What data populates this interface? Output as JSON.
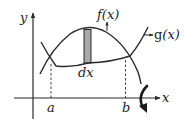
{
  "diagram": {
    "type": "area-between-curves-revolution",
    "labels": {
      "y_axis": "y",
      "x_axis": "x",
      "upper_curve": "f(x)",
      "upper_curve_f": "f",
      "upper_curve_arg": "(x)",
      "lower_curve": "g(x)",
      "lower_curve_g": "g",
      "lower_curve_arg": "(x)",
      "lower_bound": "a",
      "upper_bound": "b",
      "strip_width": "dx"
    },
    "elements": {
      "strip": "shaded vertical rectangle between curves",
      "rotation_arrow": "curved arrow indicating revolution about the x-axis",
      "dashed_lines": [
        "x = a",
        "x = b"
      ]
    },
    "colors": {
      "stroke": "#2a2a2a",
      "strip_fill": "#a9a9a9",
      "background": "#ffffff"
    }
  }
}
